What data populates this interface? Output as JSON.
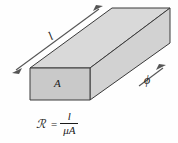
{
  "figure": {
    "kind": "magnetic-core-reluctance-diagram",
    "background_color": "#fefefe",
    "labels": {
      "length": "l",
      "area": "A",
      "flux": "ϕ"
    },
    "formula": {
      "lhs": "ℛ",
      "equals": "=",
      "numerator": "l",
      "denominator": "μA"
    },
    "colors": {
      "face_front": "#c9c9c9",
      "face_top": "#d9d9d9",
      "face_side": "#d2d2d2",
      "outline": "#3a3a3a",
      "arrow": "#555555",
      "text": "#1a1a1a"
    }
  }
}
